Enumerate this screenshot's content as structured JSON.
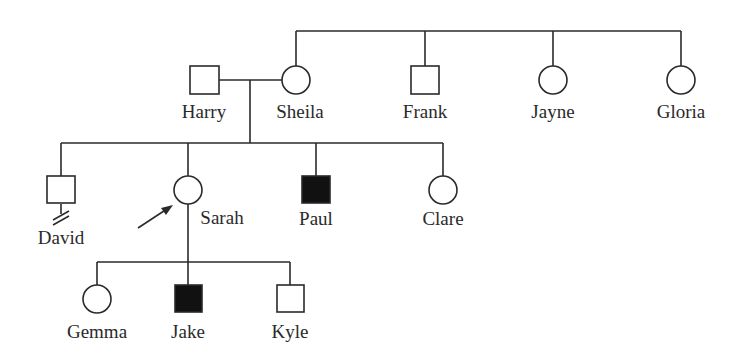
{
  "diagram": {
    "type": "pedigree",
    "legend": {
      "affected_fill": "#111111",
      "unaffected_fill": "#ffffff",
      "line_color": "#2a2a2a"
    },
    "generations": [
      {
        "level": "I",
        "members": [
          {
            "id": "harry",
            "name": "Harry",
            "sex": "male",
            "affected": false
          },
          {
            "id": "sheila",
            "name": "Sheila",
            "sex": "female",
            "affected": false
          },
          {
            "id": "frank",
            "name": "Frank",
            "sex": "male",
            "affected": false
          },
          {
            "id": "jayne",
            "name": "Jayne",
            "sex": "female",
            "affected": false
          },
          {
            "id": "gloria",
            "name": "Gloria",
            "sex": "female",
            "affected": false
          }
        ]
      },
      {
        "level": "II",
        "members": [
          {
            "id": "david",
            "name": "David",
            "sex": "male",
            "affected": false,
            "note": "no offspring marker (double slash)"
          },
          {
            "id": "sarah",
            "name": "Sarah",
            "sex": "female",
            "affected": false,
            "proband": true
          },
          {
            "id": "paul",
            "name": "Paul",
            "sex": "male",
            "affected": true
          },
          {
            "id": "clare",
            "name": "Clare",
            "sex": "female",
            "affected": false
          }
        ]
      },
      {
        "level": "III",
        "members": [
          {
            "id": "gemma",
            "name": "Gemma",
            "sex": "female",
            "affected": false
          },
          {
            "id": "jake",
            "name": "Jake",
            "sex": "male",
            "affected": true
          },
          {
            "id": "kyle",
            "name": "Kyle",
            "sex": "male",
            "affected": false
          }
        ]
      }
    ],
    "relationships": [
      {
        "type": "siblings",
        "members": [
          "sheila",
          "frank",
          "jayne",
          "gloria"
        ]
      },
      {
        "type": "mating",
        "members": [
          "harry",
          "sheila"
        ]
      },
      {
        "type": "children_of",
        "parents": [
          "harry",
          "sheila"
        ],
        "children": [
          "david",
          "sarah",
          "paul",
          "clare"
        ]
      },
      {
        "type": "children_of",
        "parents": [
          "sarah"
        ],
        "children": [
          "gemma",
          "jake",
          "kyle"
        ]
      }
    ]
  },
  "labels": {
    "harry": "Harry",
    "sheila": "Sheila",
    "frank": "Frank",
    "jayne": "Jayne",
    "gloria": "Gloria",
    "david": "David",
    "sarah": "Sarah",
    "paul": "Paul",
    "clare": "Clare",
    "gemma": "Gemma",
    "jake": "Jake",
    "kyle": "Kyle"
  }
}
